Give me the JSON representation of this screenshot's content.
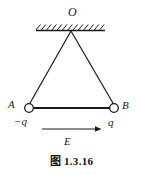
{
  "figure": {
    "caption": "图 1.3.16",
    "labels": {
      "apex": "O",
      "left_point": "A",
      "right_point": "B",
      "left_charge": "−q",
      "right_charge": "q",
      "field": "E"
    },
    "colors": {
      "ink": "#1a1a1a",
      "background": "#ffffff"
    },
    "geometry": {
      "ceiling": {
        "x1": 36,
        "y1": 30,
        "x2": 105,
        "y2": 30
      },
      "hatch": {
        "count": 13,
        "slant": "up-right",
        "side": "above",
        "length": 6
      },
      "apex_point": {
        "x": 71,
        "y": 30
      },
      "left_node": {
        "x": 29,
        "y": 108,
        "r": 4.5
      },
      "right_node": {
        "x": 114,
        "y": 108,
        "r": 4.5
      },
      "rod": {
        "x1": 33.5,
        "y1": 108,
        "x2": 109.5,
        "y2": 108
      },
      "field_arrow": {
        "x1": 42,
        "y1": 129,
        "x2": 101,
        "y2": 129
      }
    }
  }
}
